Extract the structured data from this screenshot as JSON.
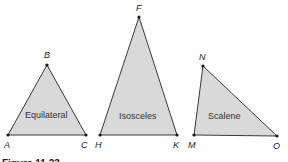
{
  "figure": {
    "caption": "Figure 11.23",
    "fill_color": "#d9d9d9",
    "stroke_color": "#3a3a3a",
    "triangles": [
      {
        "name": "Equilateral",
        "label": "Equilateral",
        "vertices": [
          {
            "id": "A",
            "x": 8,
            "y": 135
          },
          {
            "id": "B",
            "x": 47,
            "y": 65
          },
          {
            "id": "C",
            "x": 86,
            "y": 135
          }
        ]
      },
      {
        "name": "Isosceles",
        "label": "Isosceles",
        "vertices": [
          {
            "id": "H",
            "x": 100,
            "y": 135
          },
          {
            "id": "F",
            "x": 139,
            "y": 17
          },
          {
            "id": "K",
            "x": 177,
            "y": 135
          }
        ]
      },
      {
        "name": "Scalene",
        "label": "Scalene",
        "vertices": [
          {
            "id": "M",
            "x": 194,
            "y": 135
          },
          {
            "id": "N",
            "x": 203,
            "y": 66
          },
          {
            "id": "O",
            "x": 277,
            "y": 136
          }
        ]
      }
    ],
    "vertex_labels": {
      "A": "A",
      "B": "B",
      "C": "C",
      "F": "F",
      "H": "H",
      "K": "K",
      "M": "M",
      "N": "N",
      "O": "O"
    }
  }
}
